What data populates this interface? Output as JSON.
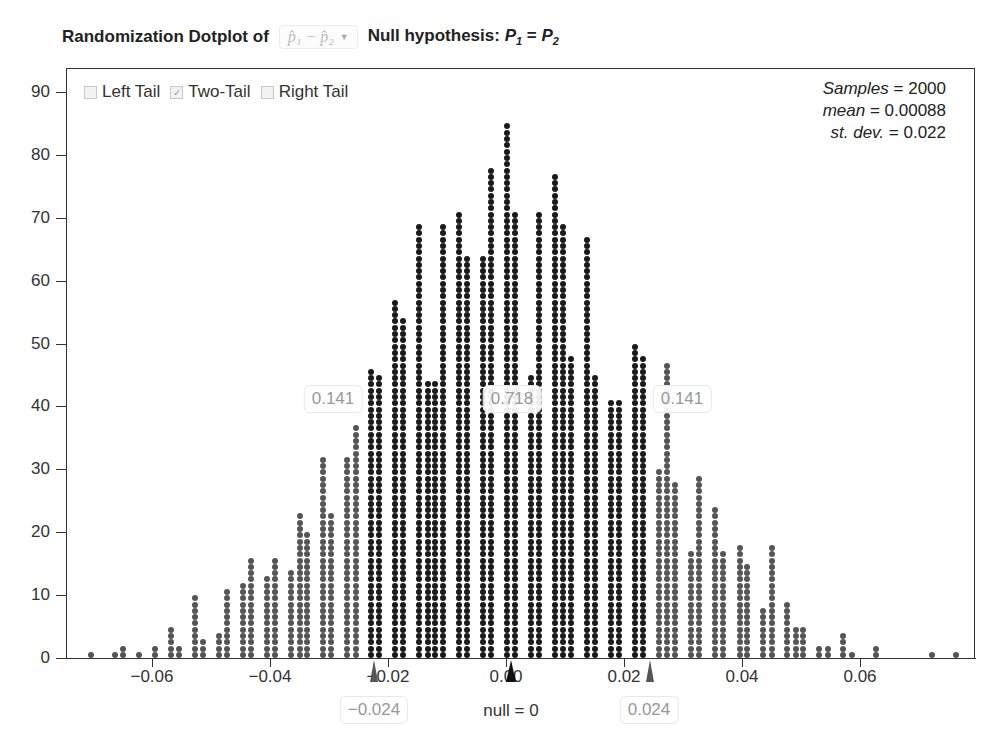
{
  "header": {
    "title_prefix": "Randomization Dotplot of",
    "statistic_selector": "p̂₁ − p̂₂",
    "hypothesis_label": "Null hypothesis:",
    "hypothesis_lhs": "P",
    "hypothesis_lhs_sub": "1",
    "hypothesis_eq": " = ",
    "hypothesis_rhs": "P",
    "hypothesis_rhs_sub": "2"
  },
  "legend": {
    "left_tail": {
      "label": "Left Tail",
      "checked": false
    },
    "two_tail": {
      "label": "Two-Tail",
      "checked": true
    },
    "right_tail": {
      "label": "Right Tail",
      "checked": false
    }
  },
  "stats": {
    "samples_label": "Samples",
    "samples": "2000",
    "mean_label": "mean",
    "mean": "0.00088",
    "sd_label": "st. dev.",
    "sd": "0.022"
  },
  "tails": {
    "left_prop": "0.141",
    "center_prop": "0.718",
    "right_prop": "0.141",
    "left_cut": "−0.024",
    "right_cut": "0.024",
    "null_label": "null = 0"
  },
  "colors": {
    "inner": "#1a1a1a",
    "tail": "#555555"
  },
  "chart_data": {
    "type": "dotplot",
    "xlabel": "null = 0",
    "ylabel": "",
    "yticks": [
      0,
      10,
      20,
      30,
      40,
      50,
      60,
      70,
      80,
      90
    ],
    "xticks": [
      "−0.06",
      "−0.04",
      "−0.02",
      "0.00",
      "0.02",
      "0.04",
      "0.06"
    ],
    "xlim": [
      -0.075,
      0.079
    ],
    "ylim": [
      0,
      93
    ],
    "cutoffs": [
      -0.024,
      0.024
    ],
    "columns": [
      {
        "x": -0.0704,
        "count": 1
      },
      {
        "x": -0.0663,
        "count": 1
      },
      {
        "x": -0.065,
        "count": 2
      },
      {
        "x": -0.0622,
        "count": 1
      },
      {
        "x": -0.0595,
        "count": 2
      },
      {
        "x": -0.0568,
        "count": 5
      },
      {
        "x": -0.0554,
        "count": 2
      },
      {
        "x": -0.0527,
        "count": 10
      },
      {
        "x": -0.0513,
        "count": 3
      },
      {
        "x": -0.0486,
        "count": 4
      },
      {
        "x": -0.0473,
        "count": 11
      },
      {
        "x": -0.0445,
        "count": 12
      },
      {
        "x": -0.0432,
        "count": 16
      },
      {
        "x": -0.0405,
        "count": 13
      },
      {
        "x": -0.0391,
        "count": 16
      },
      {
        "x": -0.0364,
        "count": 14
      },
      {
        "x": -0.035,
        "count": 23
      },
      {
        "x": -0.0337,
        "count": 20
      },
      {
        "x": -0.031,
        "count": 32
      },
      {
        "x": -0.0296,
        "count": 23
      },
      {
        "x": -0.0269,
        "count": 32
      },
      {
        "x": -0.0255,
        "count": 37
      },
      {
        "x": -0.0228,
        "count": 46
      },
      {
        "x": -0.0215,
        "count": 45
      },
      {
        "x": -0.0188,
        "count": 57
      },
      {
        "x": -0.0174,
        "count": 54
      },
      {
        "x": -0.0147,
        "count": 69
      },
      {
        "x": -0.0133,
        "count": 44
      },
      {
        "x": -0.012,
        "count": 44
      },
      {
        "x": -0.0106,
        "count": 69
      },
      {
        "x": -0.0079,
        "count": 71
      },
      {
        "x": -0.0066,
        "count": 64
      },
      {
        "x": -0.0039,
        "count": 64
      },
      {
        "x": -0.0025,
        "count": 78
      },
      {
        "x": 0.0002,
        "count": 85
      },
      {
        "x": 0.0015,
        "count": 71
      },
      {
        "x": 0.0042,
        "count": 45
      },
      {
        "x": 0.0056,
        "count": 71
      },
      {
        "x": 0.0083,
        "count": 77
      },
      {
        "x": 0.0097,
        "count": 69
      },
      {
        "x": 0.011,
        "count": 48
      },
      {
        "x": 0.0137,
        "count": 67
      },
      {
        "x": 0.0151,
        "count": 45
      },
      {
        "x": 0.0178,
        "count": 41
      },
      {
        "x": 0.0192,
        "count": 41
      },
      {
        "x": 0.0219,
        "count": 50
      },
      {
        "x": 0.0232,
        "count": 48
      },
      {
        "x": 0.026,
        "count": 30
      },
      {
        "x": 0.0273,
        "count": 47
      },
      {
        "x": 0.0287,
        "count": 28
      },
      {
        "x": 0.0314,
        "count": 17
      },
      {
        "x": 0.0327,
        "count": 29
      },
      {
        "x": 0.0355,
        "count": 24
      },
      {
        "x": 0.0368,
        "count": 17
      },
      {
        "x": 0.0396,
        "count": 18
      },
      {
        "x": 0.0409,
        "count": 15
      },
      {
        "x": 0.0436,
        "count": 8
      },
      {
        "x": 0.045,
        "count": 18
      },
      {
        "x": 0.0477,
        "count": 9
      },
      {
        "x": 0.0491,
        "count": 5
      },
      {
        "x": 0.0504,
        "count": 5
      },
      {
        "x": 0.0531,
        "count": 2
      },
      {
        "x": 0.0545,
        "count": 2
      },
      {
        "x": 0.0572,
        "count": 4
      },
      {
        "x": 0.0586,
        "count": 1
      },
      {
        "x": 0.0627,
        "count": 2
      },
      {
        "x": 0.0722,
        "count": 1
      },
      {
        "x": 0.0763,
        "count": 1
      }
    ]
  }
}
